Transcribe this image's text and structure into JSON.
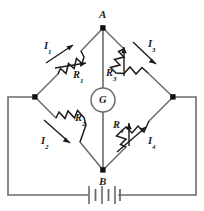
{
  "figure": {
    "type": "circuit-diagram",
    "colors": {
      "wire": "#6b6b6b",
      "symbol": "#1c1c1c",
      "background": "#ffffff"
    }
  },
  "nodes": {
    "top": {
      "label": "A",
      "x": 103,
      "y": 28
    },
    "bottom": {
      "label": "B",
      "x": 103,
      "y": 170
    },
    "left": {
      "label": "",
      "x": 35,
      "y": 97
    },
    "right": {
      "label": "",
      "x": 173,
      "y": 97
    }
  },
  "meter": {
    "label": "G",
    "name": "galvanometer",
    "cx": 103,
    "cy": 100,
    "r": 12
  },
  "resistors": [
    {
      "id": "R1",
      "label": "R",
      "subscript": "1",
      "variable": true,
      "arm": "top-left"
    },
    {
      "id": "R2",
      "label": "R",
      "subscript": "2",
      "variable": false,
      "arm": "bottom-left"
    },
    {
      "id": "R3",
      "label": "R",
      "subscript": "3",
      "variable": true,
      "arm": "top-right"
    },
    {
      "id": "R4",
      "label": "R",
      "subscript": "4",
      "variable": true,
      "arm": "bottom-right"
    }
  ],
  "currents": [
    {
      "id": "I1",
      "label": "I",
      "subscript": "1",
      "arm": "top-left",
      "direction": "toward-A"
    },
    {
      "id": "I2",
      "label": "I",
      "subscript": "2",
      "arm": "bottom-left",
      "direction": "toward-B"
    },
    {
      "id": "I3",
      "label": "I",
      "subscript": "3",
      "arm": "top-right",
      "direction": "away-from-A"
    },
    {
      "id": "I4",
      "label": "I",
      "subscript": "4",
      "arm": "bottom-right",
      "direction": "toward-right-node"
    }
  ],
  "battery": {
    "name": "battery",
    "cells": 3,
    "cx": 103,
    "cy": 195
  }
}
